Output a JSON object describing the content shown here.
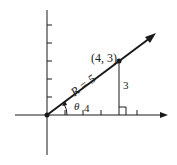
{
  "diagram": {
    "type": "vector-polar-coordinates",
    "colors": {
      "ink": "#1a1a1a",
      "background": "#ffffff"
    },
    "origin_px": [
      47,
      115
    ],
    "unit_px": 18,
    "point": {
      "label": "(4, 3)",
      "x": 4,
      "y": 3
    },
    "vector_label": "R = 5",
    "angle_label": "θ",
    "adjacent_label": "4",
    "opposite_label": "3",
    "x_ticks": [
      1,
      2,
      3,
      4,
      5
    ],
    "y_ticks": [
      1,
      2,
      3,
      4,
      5
    ]
  }
}
